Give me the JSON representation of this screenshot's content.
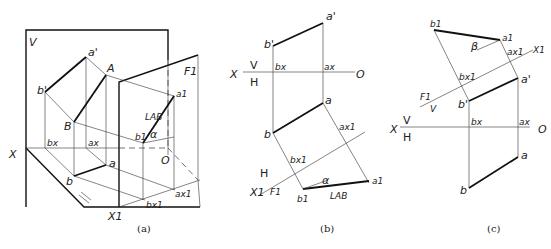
{
  "figure": {
    "panels": [
      {
        "id": "a",
        "caption": "(a)",
        "labels": {
          "plane_v": "V",
          "plane_f1": "F1",
          "axis_x": "X",
          "axis_x1": "X1",
          "origin": "O",
          "a_prime": "a'",
          "b_prime": "b'",
          "A": "A",
          "B": "B",
          "a": "a",
          "b": "b",
          "a_x": "ax",
          "b_x": "bx",
          "a1": "a1",
          "b1": "b1",
          "a_x1": "ax1",
          "b_x1": "bx1",
          "true_length": "LAB",
          "angle": "α",
          "equal_mark": "="
        }
      },
      {
        "id": "b",
        "caption": "(b)",
        "labels": {
          "axis_x": "X",
          "axis_o": "O",
          "plane_v": "V",
          "plane_h": "H",
          "a_prime": "a'",
          "b_prime": "b'",
          "a_x": "ax",
          "b_x": "bx",
          "a": "a",
          "b": "b",
          "a_x1": "ax1",
          "b_x1": "bx1",
          "axis_x1": "X1",
          "plane_h2": "H",
          "plane_f1": "F1",
          "a1": "a1",
          "b1": "b1",
          "angle": "α",
          "true_length": "LAB"
        }
      },
      {
        "id": "c",
        "caption": "(c)",
        "labels": {
          "b1": "b1",
          "a1": "a1",
          "angle": "β",
          "a_x1": "ax1",
          "axis_x1": "X1",
          "b_x1": "bx1",
          "plane_f1": "F1",
          "plane_v2": "V",
          "a_prime": "a'",
          "b_prime": "b'",
          "axis_x": "X",
          "plane_v": "V",
          "plane_h": "H",
          "b_x": "bx",
          "a_x": "ax",
          "axis_o": "O",
          "a": "a",
          "b": "b"
        }
      }
    ]
  }
}
